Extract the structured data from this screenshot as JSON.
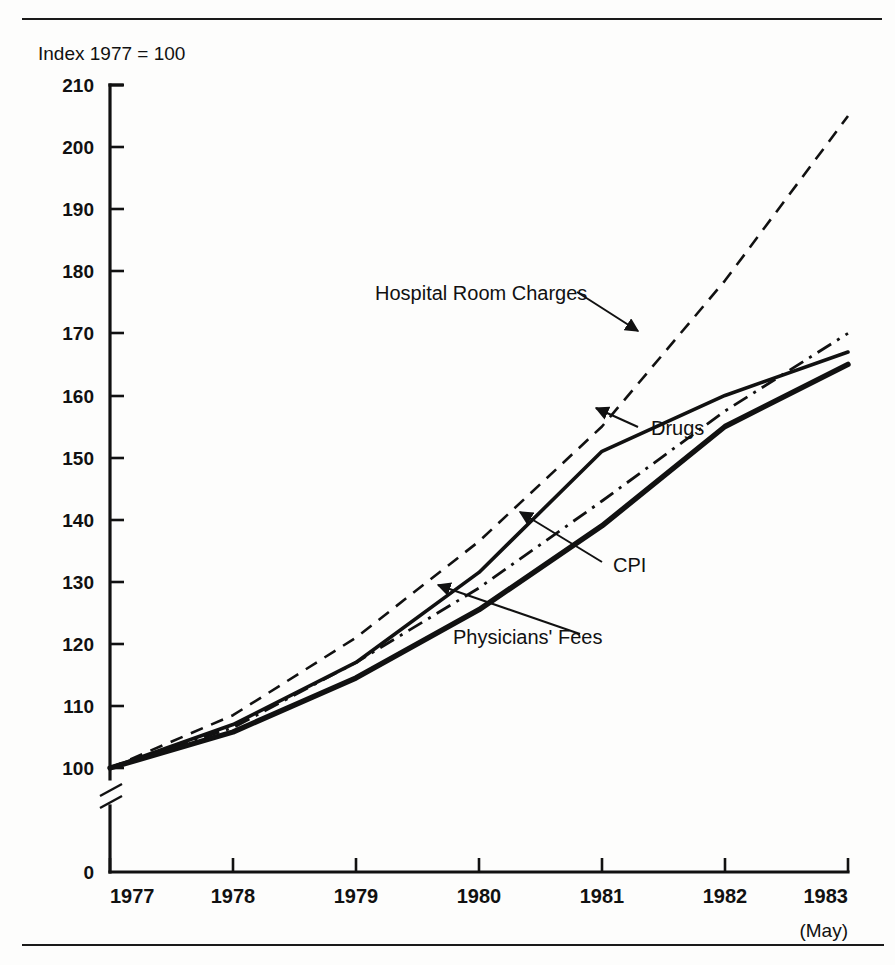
{
  "figure": {
    "index_note": "Index 1977 = 100",
    "x_footnote": "(May)",
    "top_rule": "horizontal-rule",
    "bottom_rule": "horizontal-rule"
  },
  "chart_data": {
    "type": "line",
    "title": "",
    "subtitle": "",
    "xlabel": "",
    "ylabel": "Index 1977 = 100",
    "x": [
      1977,
      1978,
      1979,
      1980,
      1981,
      1982,
      1983
    ],
    "xtick_labels": [
      "1977",
      "1978",
      "1979",
      "1980",
      "1981",
      "1982",
      "1983"
    ],
    "xlim": [
      1977,
      1983
    ],
    "ylim": [
      100,
      210
    ],
    "ytick_labels": [
      "0",
      "100",
      "110",
      "120",
      "130",
      "140",
      "150",
      "160",
      "170",
      "180",
      "190",
      "200",
      "210"
    ],
    "ytick_values": [
      0,
      100,
      110,
      120,
      130,
      140,
      150,
      160,
      170,
      180,
      190,
      200,
      210
    ],
    "y_axis_break": true,
    "y_axis_break_note": "axis broken between 0 and 100",
    "grid": false,
    "legend_position": "inline-annotations",
    "series": [
      {
        "name": "Hospital Room Charges",
        "style": "dashed",
        "linewidth": 2.4,
        "values": [
          100,
          108.5,
          121,
          136.5,
          155,
          178.5,
          205
        ],
        "label_x": 1983,
        "label_y": 205
      },
      {
        "name": "Drugs",
        "style": "solid-thin",
        "linewidth": 3.4,
        "values": [
          100,
          107,
          117,
          131.5,
          151,
          160,
          167
        ],
        "label_x": 1983,
        "label_y": 167
      },
      {
        "name": "CPI",
        "style": "dash-dot",
        "linewidth": 2.6,
        "values": [
          100,
          106.5,
          117,
          129,
          143,
          157.5,
          170
        ],
        "label_x": 1983,
        "label_y": 170
      },
      {
        "name": "Physicians' Fees",
        "style": "solid-thick",
        "linewidth": 5.0,
        "values": [
          100,
          105.8,
          114.5,
          125.5,
          139,
          155,
          165
        ],
        "label_x": 1983,
        "label_y": 165
      }
    ],
    "annotations": [
      {
        "text": "Hospital Room Charges",
        "target_series": "Hospital Room Charges",
        "text_x": 380,
        "text_y": 296
      },
      {
        "text": "Drugs",
        "target_series": "Drugs",
        "text_x": 655,
        "text_y": 432
      },
      {
        "text": "CPI",
        "target_series": "CPI",
        "text_x": 618,
        "text_y": 570
      },
      {
        "text": "Physicians' Fees",
        "target_series": "Physicians' Fees",
        "text_x": 458,
        "text_y": 641
      }
    ]
  }
}
